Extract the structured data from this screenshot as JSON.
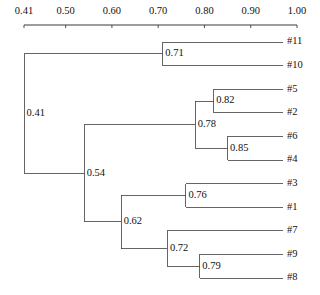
{
  "chart_data": {
    "type": "dendrogram",
    "title": "",
    "xlabel": "",
    "ylabel": "",
    "xlim": [
      0.41,
      1.0
    ],
    "grid": false,
    "legend": null,
    "axis": {
      "orientation": "top",
      "ticks": [
        {
          "value": 0.41,
          "label": "0.41"
        },
        {
          "value": 0.5,
          "label": "0.50"
        },
        {
          "value": 0.6,
          "label": "0.60"
        },
        {
          "value": 0.7,
          "label": "0.70"
        },
        {
          "value": 0.8,
          "label": "0.80"
        },
        {
          "value": 0.9,
          "label": "0.90"
        },
        {
          "value": 1.0,
          "label": "1.00"
        }
      ]
    },
    "leaves": [
      {
        "label": "#11",
        "order": 0
      },
      {
        "label": "#10",
        "order": 1
      },
      {
        "label": "#5",
        "order": 2
      },
      {
        "label": "#2",
        "order": 3
      },
      {
        "label": "#6",
        "order": 4
      },
      {
        "label": "#4",
        "order": 5
      },
      {
        "label": "#3",
        "order": 6
      },
      {
        "label": "#1",
        "order": 7
      },
      {
        "label": "#7",
        "order": 8
      },
      {
        "label": "#9",
        "order": 9
      },
      {
        "label": "#8",
        "order": 10
      }
    ],
    "nodes": [
      {
        "id": "n041",
        "value": 0.41,
        "label": "0.41",
        "children": [
          "n071",
          "n054"
        ]
      },
      {
        "id": "n071",
        "value": 0.71,
        "label": "0.71",
        "children": [
          "#11",
          "#10"
        ]
      },
      {
        "id": "n054",
        "value": 0.54,
        "label": "0.54",
        "children": [
          "n078",
          "n062"
        ]
      },
      {
        "id": "n078",
        "value": 0.78,
        "label": "0.78",
        "children": [
          "n082",
          "n085"
        ]
      },
      {
        "id": "n082",
        "value": 0.82,
        "label": "0.82",
        "children": [
          "#5",
          "#2"
        ]
      },
      {
        "id": "n085",
        "value": 0.85,
        "label": "0.85",
        "children": [
          "#6",
          "#4"
        ]
      },
      {
        "id": "n062",
        "value": 0.62,
        "label": "0.62",
        "children": [
          "n076",
          "n072"
        ]
      },
      {
        "id": "n076",
        "value": 0.76,
        "label": "0.76",
        "children": [
          "#3",
          "#1"
        ]
      },
      {
        "id": "n072",
        "value": 0.72,
        "label": "0.72",
        "children": [
          "#7",
          "n079"
        ]
      },
      {
        "id": "n079",
        "value": 0.79,
        "label": "0.79",
        "children": [
          "#9",
          "#8"
        ]
      }
    ],
    "merge_values": [
      0.41,
      0.54,
      0.62,
      0.71,
      0.72,
      0.76,
      0.78,
      0.79,
      0.82,
      0.85
    ]
  },
  "geometry": {
    "axis_y": 25,
    "axis_x_start": 24,
    "axis_x_end": 297,
    "tick_label_y": 14,
    "tick_len": 3,
    "leaf_first_y": 42,
    "leaf_spacing": 23.6,
    "leaf_line_end": 283,
    "leaf_label_x": 287,
    "node_label_dx": 2.5
  },
  "colors": {
    "background": "#ffffff",
    "branch": "#4a4a4a",
    "axis": "#3a3a3a",
    "text": "#111111"
  }
}
